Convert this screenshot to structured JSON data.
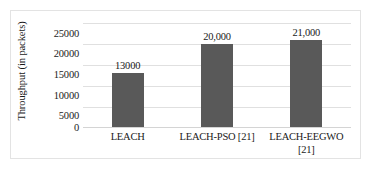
{
  "chart_data": {
    "type": "bar",
    "title": "",
    "xlabel": "",
    "ylabel": "Throughput (in packets)",
    "categories": [
      "LEACH",
      "LEACH-PSO [21]",
      "LEACH-EEGWO [21]"
    ],
    "values": [
      13000,
      20000,
      21000
    ],
    "value_labels": [
      "13000",
      "20,000",
      "21,000"
    ],
    "ylim": [
      0,
      25000
    ],
    "ytick_labels": [
      "25000",
      "20000",
      "15000",
      "10000",
      "5000",
      "0"
    ],
    "ytick_values": [
      25000,
      20000,
      15000,
      10000,
      5000,
      0
    ],
    "grid": "horizontal",
    "legend": "none",
    "series": [
      {
        "name": "Throughput",
        "values": [
          13000,
          20000,
          21000
        ],
        "color": "#595959"
      }
    ]
  },
  "axes": {
    "y_title": "Throughput (in packets)",
    "ticks": [
      {
        "label": "25000"
      },
      {
        "label": "20000"
      },
      {
        "label": "15000"
      },
      {
        "label": "10000"
      },
      {
        "label": "5000"
      },
      {
        "label": "0"
      }
    ]
  },
  "bars": [
    {
      "category": "LEACH",
      "value_label": "13000"
    },
    {
      "category": "LEACH-PSO [21]",
      "value_label": "20,000"
    },
    {
      "category": "LEACH-EEGWO [21]",
      "value_label": "21,000"
    }
  ],
  "x_labels": [
    {
      "line1": "LEACH",
      "line2": ""
    },
    {
      "line1": "LEACH-PSO [21]",
      "line2": ""
    },
    {
      "line1": "LEACH-EEGWO",
      "line2": "[21]"
    }
  ],
  "colors": {
    "bar": "#595959",
    "gridline": "#e0e0e0",
    "frame": "#e3e3e3",
    "text": "#1a1a1a"
  }
}
